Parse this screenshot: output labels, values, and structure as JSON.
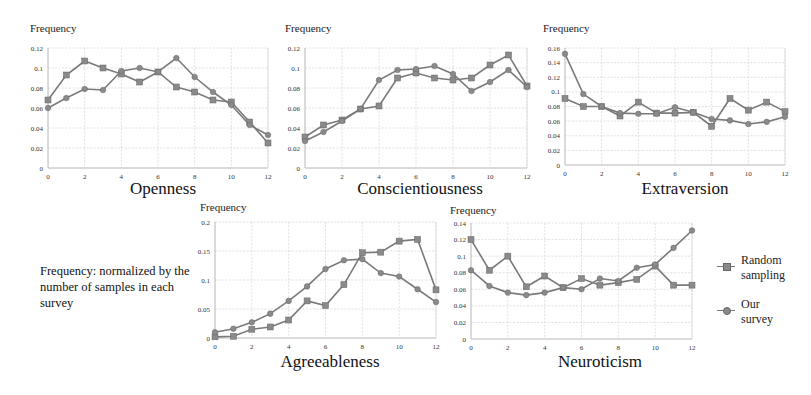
{
  "figure": {
    "note": "Frequency: normalized by the number of samples in each survey",
    "ylabel": "Frequency",
    "legend": [
      {
        "label_line1": "Random",
        "label_line2": "sampling",
        "marker": "square"
      },
      {
        "label_line1": "Our",
        "label_line2": "survey",
        "marker": "circle"
      }
    ],
    "colors": {
      "line": "#7a7a7a",
      "marker": "#8a8a8a",
      "grid": "#d8d8d8"
    }
  },
  "chart_data": [
    {
      "type": "line",
      "title": "Openness",
      "xlabel": "Openness",
      "ylabel": "Frequency",
      "x": [
        0,
        1,
        2,
        3,
        4,
        5,
        6,
        7,
        8,
        9,
        10,
        11,
        12
      ],
      "xticks": [
        0,
        2,
        4,
        6,
        8,
        10,
        12
      ],
      "yticks": [
        0,
        0.02,
        0.04,
        0.06,
        0.08,
        0.1,
        0.12
      ],
      "ytick_labels": [
        "0",
        "0.02",
        "0.04",
        "0.06",
        "0.08",
        "0.1",
        "0.12"
      ],
      "ylim": [
        0,
        0.12
      ],
      "grid": true,
      "series": [
        {
          "name": "Random sampling",
          "marker": "square",
          "values": [
            0.068,
            0.093,
            0.107,
            0.1,
            0.094,
            0.086,
            0.096,
            0.081,
            0.076,
            0.068,
            0.066,
            0.046,
            0.025
          ]
        },
        {
          "name": "Our survey",
          "marker": "circle",
          "values": [
            0.06,
            0.07,
            0.079,
            0.078,
            0.097,
            0.1,
            0.096,
            0.11,
            0.091,
            0.076,
            0.063,
            0.043,
            0.033
          ]
        }
      ]
    },
    {
      "type": "line",
      "title": "Conscientiousness",
      "xlabel": "Conscientiousness",
      "ylabel": "Frequency",
      "x": [
        0,
        1,
        2,
        3,
        4,
        5,
        6,
        7,
        8,
        9,
        10,
        11,
        12
      ],
      "xticks": [
        0,
        2,
        4,
        6,
        8,
        10,
        12
      ],
      "yticks": [
        0,
        0.02,
        0.04,
        0.06,
        0.08,
        0.1,
        0.12
      ],
      "ytick_labels": [
        "0",
        "0.02",
        "0.04",
        "0.06",
        "0.08",
        "0.1",
        "0.12"
      ],
      "ylim": [
        0,
        0.12
      ],
      "grid": true,
      "series": [
        {
          "name": "Random sampling",
          "marker": "square",
          "values": [
            0.031,
            0.043,
            0.048,
            0.059,
            0.062,
            0.09,
            0.095,
            0.09,
            0.088,
            0.09,
            0.103,
            0.113,
            0.082
          ]
        },
        {
          "name": "Our survey",
          "marker": "circle",
          "values": [
            0.027,
            0.036,
            0.047,
            0.059,
            0.088,
            0.098,
            0.099,
            0.102,
            0.094,
            0.077,
            0.086,
            0.098,
            0.081
          ]
        }
      ]
    },
    {
      "type": "line",
      "title": "Extraversion",
      "xlabel": "Extraversion",
      "ylabel": "Frequency",
      "x": [
        0,
        1,
        2,
        3,
        4,
        5,
        6,
        7,
        8,
        9,
        10,
        11,
        12
      ],
      "xticks": [
        0,
        2,
        4,
        6,
        8,
        10,
        12
      ],
      "yticks": [
        0,
        0.02,
        0.04,
        0.06,
        0.08,
        0.1,
        0.12,
        0.14,
        0.16
      ],
      "ytick_labels": [
        "0",
        "0.02",
        "0.04",
        "0.06",
        "0.08",
        "0.1",
        "0.12",
        "0.14",
        "0.16"
      ],
      "ylim": [
        0,
        0.16
      ],
      "grid": true,
      "series": [
        {
          "name": "Random sampling",
          "marker": "square",
          "values": [
            0.091,
            0.08,
            0.08,
            0.067,
            0.086,
            0.071,
            0.071,
            0.072,
            0.053,
            0.091,
            0.075,
            0.086,
            0.073
          ]
        },
        {
          "name": "Our survey",
          "marker": "circle",
          "values": [
            0.152,
            0.097,
            0.08,
            0.071,
            0.07,
            0.07,
            0.079,
            0.072,
            0.063,
            0.061,
            0.056,
            0.059,
            0.066
          ]
        }
      ]
    },
    {
      "type": "line",
      "title": "Agreeableness",
      "xlabel": "Agreeableness",
      "ylabel": "Frequency",
      "x": [
        0,
        1,
        2,
        3,
        4,
        5,
        6,
        7,
        8,
        9,
        10,
        11,
        12
      ],
      "xticks": [
        0,
        2,
        4,
        6,
        8,
        10,
        12
      ],
      "yticks": [
        0,
        0.05,
        0.1,
        0.15,
        0.2
      ],
      "ytick_labels": [
        "0",
        "0.05",
        "0.1",
        "0.15",
        "0.2"
      ],
      "ylim": [
        0,
        0.2
      ],
      "grid": true,
      "series": [
        {
          "name": "Random sampling",
          "marker": "square",
          "values": [
            0.002,
            0.003,
            0.015,
            0.019,
            0.031,
            0.064,
            0.056,
            0.092,
            0.147,
            0.148,
            0.167,
            0.17,
            0.083
          ]
        },
        {
          "name": "Our survey",
          "marker": "circle",
          "values": [
            0.01,
            0.016,
            0.027,
            0.042,
            0.064,
            0.089,
            0.119,
            0.134,
            0.136,
            0.112,
            0.106,
            0.084,
            0.062
          ]
        }
      ]
    },
    {
      "type": "line",
      "title": "Neuroticism",
      "xlabel": "Neuroticism",
      "ylabel": "Frequency",
      "x": [
        0,
        1,
        2,
        3,
        4,
        5,
        6,
        7,
        8,
        9,
        10,
        11,
        12
      ],
      "xticks": [
        0,
        2,
        4,
        6,
        8,
        10,
        12
      ],
      "yticks": [
        0,
        0.02,
        0.04,
        0.06,
        0.08,
        0.1,
        0.12,
        0.14
      ],
      "ytick_labels": [
        "0",
        "0.02",
        "0.04",
        "0.06",
        "0.08",
        "0.1",
        "0.12",
        "0.14"
      ],
      "ylim": [
        0,
        0.14
      ],
      "grid": true,
      "series": [
        {
          "name": "Random sampling",
          "marker": "square",
          "values": [
            0.12,
            0.083,
            0.1,
            0.063,
            0.076,
            0.062,
            0.073,
            0.065,
            0.068,
            0.072,
            0.088,
            0.065,
            0.065
          ]
        },
        {
          "name": "Our survey",
          "marker": "circle",
          "values": [
            0.083,
            0.064,
            0.056,
            0.053,
            0.056,
            0.062,
            0.06,
            0.073,
            0.07,
            0.086,
            0.09,
            0.11,
            0.131
          ]
        }
      ]
    }
  ]
}
